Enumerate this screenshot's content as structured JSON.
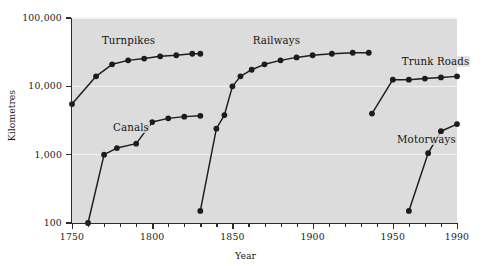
{
  "chart_data": {
    "type": "line",
    "title": "",
    "xlabel": "Year",
    "ylabel": "Kilometres",
    "xlim": [
      1750,
      1990
    ],
    "ylim": [
      100,
      100000
    ],
    "yscale": "log",
    "grid": true,
    "legend_position": "inline-annotations",
    "xticks_major": [
      1750,
      1800,
      1850,
      1900,
      1950,
      1990
    ],
    "xtick_labels": [
      "1750",
      "1800",
      "1850",
      "1900",
      "1950",
      "1990"
    ],
    "xticks_minor": [
      1760,
      1770,
      1780,
      1790,
      1810,
      1820,
      1830,
      1840,
      1860,
      1870,
      1880,
      1890,
      1910,
      1920,
      1930,
      1940,
      1960,
      1970,
      1980
    ],
    "yticks": [
      100,
      1000,
      10000,
      100000
    ],
    "ytick_labels": [
      "100",
      "1,000",
      "10,000",
      "100,000"
    ],
    "series": [
      {
        "name": "Turnpikes",
        "label_x": 1768,
        "label_y": 45000,
        "x": [
          1750,
          1765,
          1775,
          1785,
          1795,
          1805,
          1815,
          1825,
          1830
        ],
        "y": [
          5500,
          14000,
          21000,
          24000,
          25500,
          27500,
          28500,
          30000,
          30000
        ]
      },
      {
        "name": "Canals",
        "label_x": 1775,
        "label_y": 2400,
        "x": [
          1760,
          1770,
          1778,
          1790,
          1800,
          1810,
          1820,
          1830
        ],
        "y": [
          100,
          1000,
          1250,
          1450,
          3000,
          3400,
          3600,
          3700
        ]
      },
      {
        "name": "Railways",
        "label_x": 1862,
        "label_y": 45000,
        "x": [
          1830,
          1840,
          1845,
          1850,
          1855,
          1862,
          1870,
          1880,
          1890,
          1900,
          1912,
          1925,
          1935
        ],
        "y": [
          150,
          2400,
          3800,
          10000,
          14000,
          17500,
          21000,
          24000,
          26500,
          28500,
          30000,
          31000,
          31000
        ]
      },
      {
        "name": "Trunk Roads",
        "label_x": 1955,
        "label_y": 22000,
        "x": [
          1937,
          1950,
          1960,
          1970,
          1980,
          1990
        ],
        "y": [
          4000,
          12500,
          12500,
          13000,
          13500,
          14000
        ]
      },
      {
        "name": "Motorways",
        "label_x": 1952,
        "label_y": 1600,
        "x": [
          1960,
          1972,
          1980,
          1990
        ],
        "y": [
          150,
          1050,
          2200,
          2800
        ]
      }
    ]
  }
}
